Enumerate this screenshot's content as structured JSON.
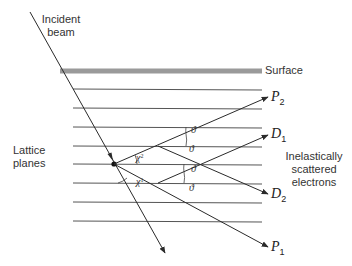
{
  "labels": {
    "incident_beam_line1": "Incident",
    "incident_beam_line2": "beam",
    "surface": "Surface",
    "lattice_line1": "Lattice",
    "lattice_line2": "planes",
    "inelastic_line1": "Inelastically",
    "inelastic_line2": "scattered",
    "inelastic_line3": "electrons"
  },
  "beams": {
    "P2": {
      "letter": "P",
      "sub": "2"
    },
    "D1": {
      "letter": "D",
      "sub": "1"
    },
    "D2": {
      "letter": "D",
      "sub": "2"
    },
    "P1": {
      "letter": "P",
      "sub": "1"
    }
  },
  "angles": {
    "chi2": {
      "symbol": "χ",
      "sup": "2"
    },
    "chi1": {
      "symbol": "χ",
      "sup": "1"
    },
    "theta": "ϑ"
  },
  "colors": {
    "line": "#2a2a2a",
    "surface": "#9a9a9a",
    "plane": "#555555"
  }
}
